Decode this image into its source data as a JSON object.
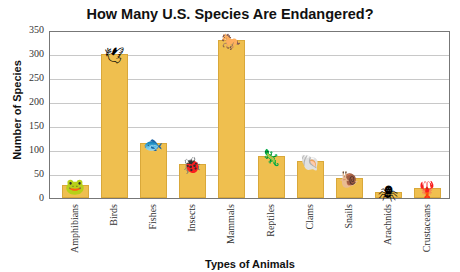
{
  "title": "How Many U.S. Species Are Endangered?",
  "chart_data": {
    "type": "bar",
    "title": "How Many U.S. Species Are Endangered?",
    "xlabel": "Types of Animals",
    "ylabel": "Number of Species",
    "categories": [
      "Amphibians",
      "Birds",
      "Fishes",
      "Insects",
      "Mammals",
      "Reptiles",
      "Clams",
      "Snails",
      "Arachnids",
      "Crustaceans"
    ],
    "values": [
      28,
      300,
      115,
      70,
      330,
      88,
      77,
      42,
      12,
      21
    ],
    "ylim": [
      0,
      350
    ],
    "yticks": [
      0,
      50,
      100,
      150,
      200,
      250,
      300,
      350
    ],
    "grid": true,
    "legend": null,
    "bar_color": "#efbf4f",
    "icons": [
      "frog-icon",
      "bird-icon",
      "fish-icon",
      "ladybug-icon",
      "horse-icon",
      "lizard-icon",
      "clam-icon",
      "snail-icon",
      "spider-icon",
      "crayfish-icon"
    ]
  }
}
